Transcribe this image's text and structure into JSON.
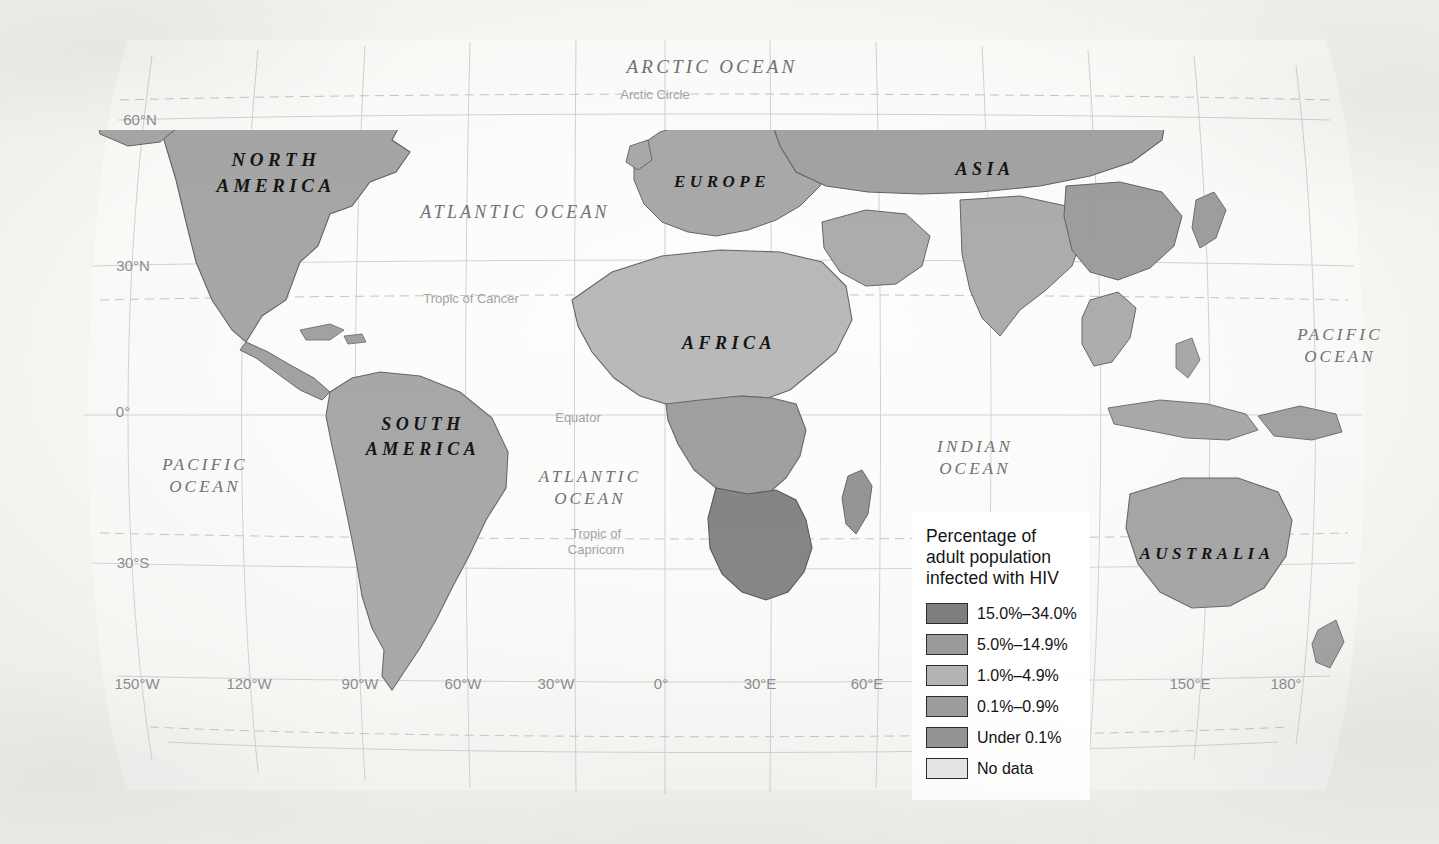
{
  "map": {
    "title": "World map of HIV prevalence",
    "projection": "Robinson",
    "continents": [
      {
        "name": "NORTH AMERICA",
        "line1": "NORTH",
        "line2": "AMERICA",
        "x": 276,
        "y": 176,
        "size": 19
      },
      {
        "name": "SOUTH AMERICA",
        "line1": "SOUTH",
        "line2": "AMERICA",
        "x": 423,
        "y": 440,
        "size": 18
      },
      {
        "name": "EUROPE",
        "line1": "EUROPE",
        "line2": "",
        "x": 722,
        "y": 187,
        "size": 17
      },
      {
        "name": "AFRICA",
        "line1": "AFRICA",
        "line2": "",
        "x": 729,
        "y": 349,
        "size": 18
      },
      {
        "name": "ASIA",
        "line1": "ASIA",
        "line2": "",
        "x": 985,
        "y": 175,
        "size": 18
      },
      {
        "name": "AUSTRALIA",
        "line1": "AUSTRALIA",
        "line2": "",
        "x": 1207,
        "y": 559,
        "size": 17
      }
    ],
    "oceans": [
      {
        "name": "ARCTIC OCEAN",
        "line1": "ARCTIC OCEAN",
        "line2": "",
        "x": 712,
        "y": 73,
        "size": 19
      },
      {
        "name": "ATLANTIC OCEAN north",
        "line1": "ATLANTIC OCEAN",
        "line2": "",
        "x": 515,
        "y": 218,
        "size": 18
      },
      {
        "name": "ATLANTIC OCEAN south",
        "line1": "ATLANTIC",
        "line2": "OCEAN",
        "x": 590,
        "y": 482,
        "size": 17
      },
      {
        "name": "PACIFIC OCEAN east",
        "line1": "PACIFIC",
        "line2": "OCEAN",
        "x": 1340,
        "y": 340,
        "size": 17
      },
      {
        "name": "PACIFIC OCEAN west",
        "line1": "PACIFIC",
        "line2": "OCEAN",
        "x": 205,
        "y": 470,
        "size": 17
      },
      {
        "name": "INDIAN OCEAN",
        "line1": "INDIAN",
        "line2": "OCEAN",
        "x": 975,
        "y": 452,
        "size": 17
      }
    ],
    "latitude_labels": [
      {
        "label": "60°N",
        "x": 140,
        "y": 125
      },
      {
        "label": "30°N",
        "x": 133,
        "y": 271
      },
      {
        "label": "0°",
        "x": 123,
        "y": 417
      },
      {
        "label": "30°S",
        "x": 133,
        "y": 568
      }
    ],
    "longitude_labels": [
      {
        "label": "150°W",
        "x": 137,
        "y": 689
      },
      {
        "label": "120°W",
        "x": 249,
        "y": 689
      },
      {
        "label": "90°W",
        "x": 360,
        "y": 689
      },
      {
        "label": "60°W",
        "x": 463,
        "y": 689
      },
      {
        "label": "30°W",
        "x": 556,
        "y": 689
      },
      {
        "label": "0°",
        "x": 661,
        "y": 689
      },
      {
        "label": "30°E",
        "x": 760,
        "y": 689
      },
      {
        "label": "60°E",
        "x": 867,
        "y": 689
      },
      {
        "label": "150°E",
        "x": 1190,
        "y": 689
      },
      {
        "label": "180°",
        "x": 1286,
        "y": 689
      }
    ],
    "reference_lines": [
      {
        "label": "Arctic Circle",
        "line1": "Arctic Circle",
        "line2": "",
        "x": 655,
        "y": 99
      },
      {
        "label": "Tropic of Cancer",
        "line1": "Tropic of Cancer",
        "line2": "",
        "x": 471,
        "y": 303
      },
      {
        "label": "Equator",
        "line1": "Equator",
        "line2": "",
        "x": 578,
        "y": 422
      },
      {
        "label": "Tropic of Capricorn",
        "line1": "Tropic of",
        "line2": "Capricorn",
        "x": 596,
        "y": 538
      }
    ]
  },
  "legend": {
    "title_line1": "Percentage of",
    "title_line2": "adult population",
    "title_line3": "infected with HIV",
    "entries": [
      {
        "label": "15.0%–34.0%",
        "color": "#7e7e7e",
        "swatch_name": "swatch-15-34"
      },
      {
        "label": "5.0%–14.9%",
        "color": "#9a9a9a",
        "swatch_name": "swatch-5-14"
      },
      {
        "label": "1.0%–4.9%",
        "color": "#b4b4b4",
        "swatch_name": "swatch-1-4"
      },
      {
        "label": "0.1%–0.9%",
        "color": "#9d9d9d",
        "swatch_name": "swatch-01-09"
      },
      {
        "label": "Under 0.1%",
        "color": "#959595",
        "swatch_name": "swatch-under-01"
      },
      {
        "label": "No data",
        "color": "#e6e6e4",
        "swatch_name": "swatch-no-data"
      }
    ]
  },
  "chart_data": {
    "type": "map",
    "title": "Percentage of adult population infected with HIV",
    "variable": "HIV prevalence in adult population (%)",
    "classes": [
      {
        "range": "15.0%–34.0%",
        "min": 15.0,
        "max": 34.0,
        "color": "#7e7e7e"
      },
      {
        "range": "5.0%–14.9%",
        "min": 5.0,
        "max": 14.9,
        "color": "#9a9a9a"
      },
      {
        "range": "1.0%–4.9%",
        "min": 1.0,
        "max": 4.9,
        "color": "#b4b4b4"
      },
      {
        "range": "0.1%–0.9%",
        "min": 0.1,
        "max": 0.9,
        "color": "#9d9d9d"
      },
      {
        "range": "Under 0.1%",
        "min": 0.0,
        "max": 0.1,
        "color": "#959595"
      },
      {
        "range": "No data",
        "min": null,
        "max": null,
        "color": "#e6e6e4"
      }
    ],
    "legend_position": "center-right",
    "grid": true,
    "graticule_interval_deg": 30
  }
}
